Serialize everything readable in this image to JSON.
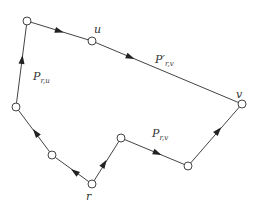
{
  "diagram": {
    "type": "directed-path-graph",
    "colors": {
      "edge": "#444444",
      "arrow": "#222222",
      "node_fill": "#ffffff",
      "label": "#333333"
    },
    "nodes": [
      {
        "id": "n_tl",
        "x": 27,
        "y": 21,
        "label": ""
      },
      {
        "id": "u",
        "x": 92,
        "y": 41,
        "label": "u"
      },
      {
        "id": "v",
        "x": 242,
        "y": 104,
        "label": "v"
      },
      {
        "id": "n_left",
        "x": 16,
        "y": 107,
        "label": ""
      },
      {
        "id": "n_mid",
        "x": 52,
        "y": 155,
        "label": ""
      },
      {
        "id": "r",
        "x": 92,
        "y": 184,
        "label": "r"
      },
      {
        "id": "n_up",
        "x": 121,
        "y": 138,
        "label": ""
      },
      {
        "id": "n_bot",
        "x": 188,
        "y": 166,
        "label": ""
      }
    ],
    "edges": [
      {
        "from": "r",
        "to": "n_mid",
        "arrow": true
      },
      {
        "from": "n_mid",
        "to": "n_left",
        "arrow": true
      },
      {
        "from": "n_left",
        "to": "n_tl",
        "arrow": true
      },
      {
        "from": "n_tl",
        "to": "u",
        "arrow": true
      },
      {
        "from": "u",
        "to": "v",
        "arrow": true
      },
      {
        "from": "r",
        "to": "n_up",
        "arrow": true
      },
      {
        "from": "n_up",
        "to": "n_bot",
        "arrow": true
      },
      {
        "from": "n_bot",
        "to": "v",
        "arrow": true
      }
    ],
    "labels": {
      "u": "u",
      "v": "v",
      "r": "r",
      "p_ru_main": "P",
      "p_ru_sub": "r,u",
      "p_prime_main": "P′",
      "p_prime_sub": "r,v",
      "p_rv_main": "P",
      "p_rv_sub": "r,v"
    }
  }
}
